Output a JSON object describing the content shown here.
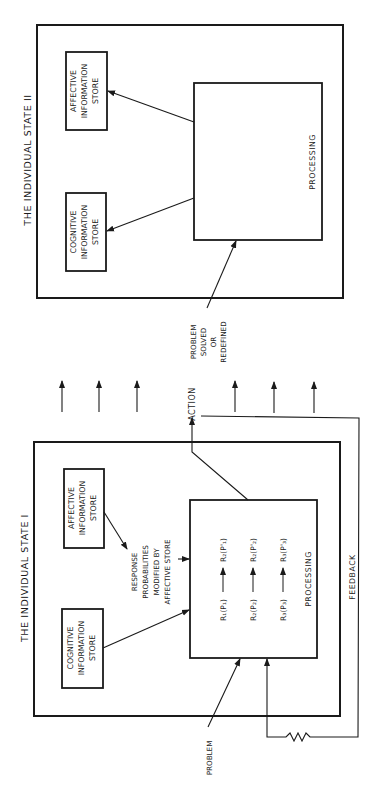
{
  "diagram": {
    "orientation": "rotated-90-ccw",
    "state_two": {
      "title": "THE INDIVIDUAL STATE II",
      "affective_store": [
        "AFFECTIVE",
        "INFORMATION",
        "STORE"
      ],
      "cognitive_store": [
        "COGNITIVE",
        "INFORMATION",
        "STORE"
      ],
      "processing_label": "PROCESSING",
      "input_label": [
        "PROBLEM",
        "SOLVED",
        "OR",
        "REDEFINED"
      ]
    },
    "transition": {
      "action_label": "ACTION",
      "arrow_count": 6
    },
    "state_one": {
      "title": "THE INDIVIDUAL STATE I",
      "affective_store": [
        "AFFECTIVE",
        "INFORMATION",
        "STORE"
      ],
      "cognitive_store": [
        "COGNITIVE",
        "INFORMATION",
        "STORE"
      ],
      "modifier_label": [
        "RESPONSE",
        "PROBABILITIES",
        "MODIFIED BY",
        "AFFECTIVE STORE"
      ],
      "processing_label": "PROCESSING",
      "processing_rows": [
        {
          "left": "R₁(P₁)",
          "right": "R₂(P'₁)"
        },
        {
          "left": "R₂(P₂)",
          "right": "R₂(P'₂)"
        },
        {
          "left": "R₃(P₃)",
          "right": "R₃(P'₃)"
        }
      ],
      "input_label": "PROBLEM",
      "feedback_label": "FEEDBACK"
    },
    "colors": {
      "ink": "#1a1a1a",
      "paper": "#ffffff"
    }
  }
}
